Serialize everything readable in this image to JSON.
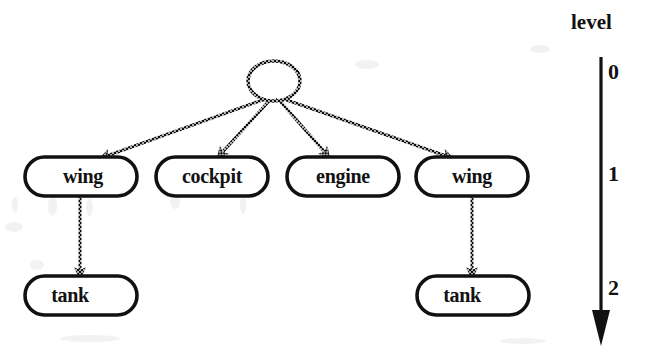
{
  "figure": {
    "kind": "hierarchical-part-decomposition-tree",
    "background_color": "#ffffff",
    "ink_color": "#111111"
  },
  "axis": {
    "title": "level",
    "title_x": 596,
    "title_y": 24,
    "line_x": 601,
    "line_top": 57,
    "line_bottom": 311,
    "arrow_tip_y": 345,
    "ticks": [
      {
        "label": "0",
        "y": 74
      },
      {
        "label": "1",
        "y": 176
      },
      {
        "label": "2",
        "y": 290
      }
    ]
  },
  "nodes": [
    {
      "id": "root",
      "label": "",
      "shape": "ellipse",
      "level": 0,
      "cx": 274,
      "cy": 81,
      "rx": 26,
      "ry": 20
    },
    {
      "id": "wing-left",
      "label": "wing",
      "shape": "rounded-box",
      "level": 1,
      "x": 25,
      "y": 157,
      "w": 112,
      "h": 39,
      "label_cx": 83,
      "label_cy": 177
    },
    {
      "id": "cockpit",
      "label": "cockpit",
      "shape": "rounded-box",
      "level": 1,
      "x": 156,
      "y": 157,
      "w": 112,
      "h": 39,
      "label_cx": 212,
      "label_cy": 177
    },
    {
      "id": "engine",
      "label": "engine",
      "shape": "rounded-box",
      "level": 1,
      "x": 287,
      "y": 157,
      "w": 112,
      "h": 39,
      "label_cx": 343,
      "label_cy": 177
    },
    {
      "id": "wing-right",
      "label": "wing",
      "shape": "rounded-box",
      "level": 1,
      "x": 416,
      "y": 157,
      "w": 112,
      "h": 39,
      "label_cx": 472,
      "label_cy": 177
    },
    {
      "id": "tank-left",
      "label": "tank",
      "shape": "rounded-box",
      "level": 2,
      "x": 25,
      "y": 276,
      "w": 112,
      "h": 39,
      "label_cx": 70,
      "label_cy": 296
    },
    {
      "id": "tank-right",
      "label": "tank",
      "shape": "rounded-box",
      "level": 2,
      "x": 417,
      "y": 276,
      "w": 112,
      "h": 39,
      "label_cx": 462,
      "label_cy": 296
    }
  ],
  "edges": [
    {
      "id": "root-to-wing-left",
      "from": "root",
      "to": "wing-left",
      "x1": 265,
      "y1": 99,
      "x2": 101,
      "y2": 158
    },
    {
      "id": "root-to-cockpit",
      "from": "root",
      "to": "cockpit",
      "x1": 270,
      "y1": 100,
      "x2": 218,
      "y2": 157
    },
    {
      "id": "root-to-engine",
      "from": "root",
      "to": "engine",
      "x1": 279,
      "y1": 100,
      "x2": 329,
      "y2": 157
    },
    {
      "id": "root-to-wing-right",
      "from": "root",
      "to": "wing-right",
      "x1": 284,
      "y1": 99,
      "x2": 452,
      "y2": 158
    },
    {
      "id": "wing-left-to-tank-left",
      "from": "wing-left",
      "to": "tank-left",
      "x1": 80,
      "y1": 196,
      "x2": 80,
      "y2": 277
    },
    {
      "id": "wing-right-to-tank-right",
      "from": "wing-right",
      "to": "tank-right",
      "x1": 472,
      "y1": 196,
      "x2": 472,
      "y2": 277
    }
  ]
}
